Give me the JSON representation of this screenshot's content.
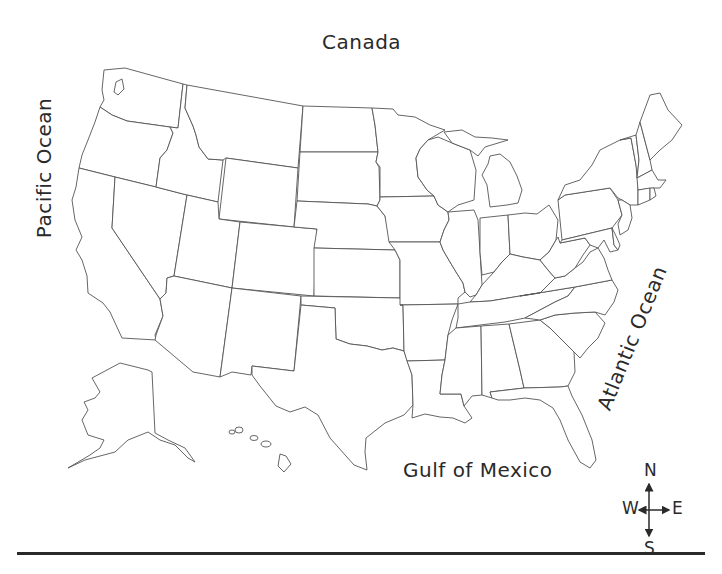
{
  "map": {
    "title": "Blank outline map of the United States",
    "labels": {
      "canada": "Canada",
      "pacific": "Pacific Ocean",
      "atlantic": "Atlantic Ocean",
      "gulf": "Gulf of Mexico"
    },
    "compass": {
      "north": "N",
      "south": "S",
      "east": "E",
      "west": "W"
    },
    "colors": {
      "background": "#ffffff",
      "outline": "#555555",
      "text": "#2a2a2a",
      "rule": "#2a2a2a"
    }
  }
}
